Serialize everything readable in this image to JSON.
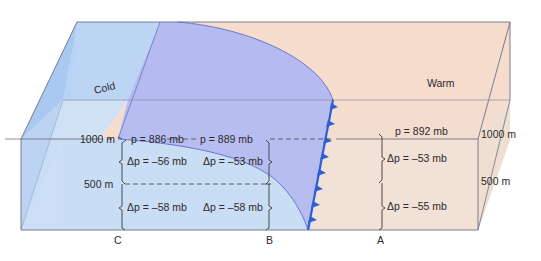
{
  "diagram": {
    "type": "block-diagram",
    "air_masses": {
      "cold_label": "Cold",
      "warm_label": "Warm"
    },
    "colors": {
      "cold_air": "#c7dcf4",
      "cold_air_top": "#b9d2f3",
      "front_wedge": "#b7bdf0",
      "warm_air": "#f5dfd3",
      "warm_air_front": "#f1e2d8",
      "front_line": "#2b5fd9",
      "edge_line": "#6b6e80"
    },
    "height_labels": {
      "left_1000": "1000 m",
      "left_500": "500 m",
      "right_1000": "1000 m",
      "right_500": "500 m"
    },
    "columns": [
      {
        "id": "C",
        "label": "C",
        "pressure_top": "p = 886 mb",
        "dp_upper": "Δp = –56 mb",
        "dp_lower": "Δp = –58 mb"
      },
      {
        "id": "B",
        "label": "B",
        "pressure_top": "p = 889 mb",
        "dp_upper": "Δp = –53 mb",
        "dp_lower": "Δp = –58 mb"
      },
      {
        "id": "A",
        "label": "A",
        "pressure_top": "p = 892 mb",
        "dp_upper": "Δp = –53 mb",
        "dp_lower": "Δp = –55 mb"
      }
    ]
  }
}
